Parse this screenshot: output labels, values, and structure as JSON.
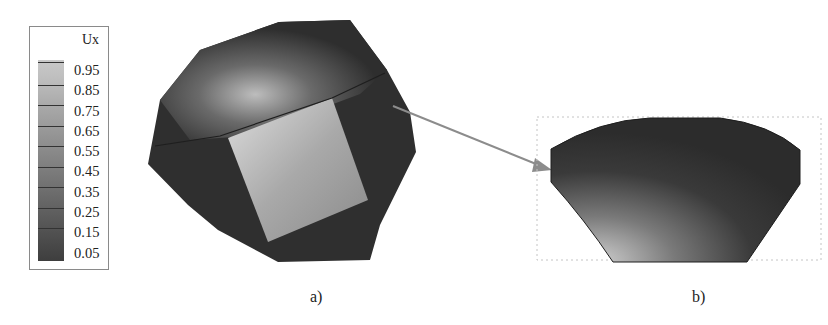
{
  "legend": {
    "title": "Ux",
    "values": [
      "0.95",
      "0.85",
      "0.75",
      "0.65",
      "0.55",
      "0.45",
      "0.35",
      "0.25",
      "0.15",
      "0.05"
    ]
  },
  "panels": [
    {
      "id": "a",
      "caption": "a)",
      "description": "Truncated polyhedron (grain) colored by Ux displacement; bright square facet in center"
    },
    {
      "id": "b",
      "caption": "b)",
      "description": "Zoomed cross-section of a boundary facet showing Ux contour gradient"
    }
  ],
  "arrow": {
    "from": "panel-a",
    "to": "panel-b",
    "color": "#8c8c8c"
  },
  "colors": {
    "dark": "#2f2f2f",
    "light": "#d8d8d8",
    "frame": "#bbbbbb"
  }
}
